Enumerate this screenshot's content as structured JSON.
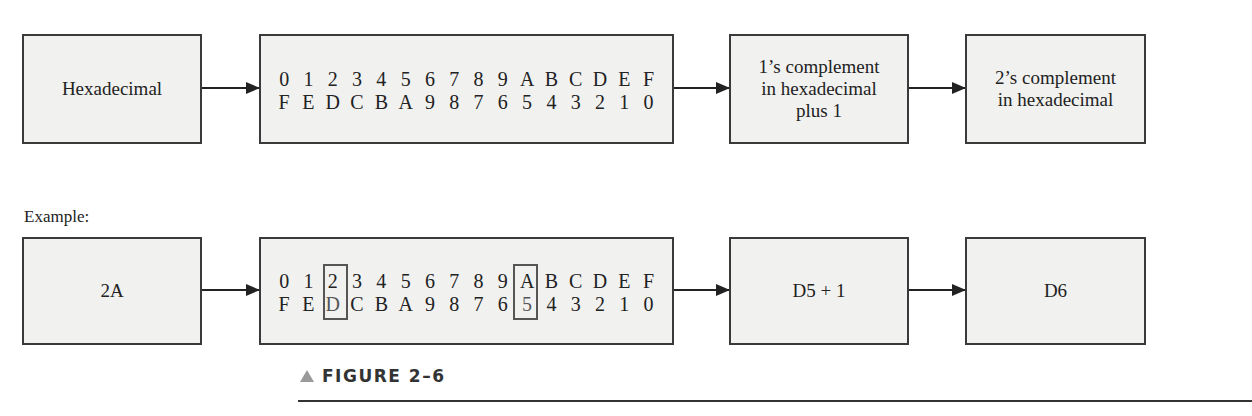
{
  "diagram": {
    "top_row": {
      "input_box": "Hexadecimal",
      "table_top": [
        "0",
        "1",
        "2",
        "3",
        "4",
        "5",
        "6",
        "7",
        "8",
        "9",
        "A",
        "B",
        "C",
        "D",
        "E",
        "F"
      ],
      "table_bottom": [
        "F",
        "E",
        "D",
        "C",
        "B",
        "A",
        "9",
        "8",
        "7",
        "6",
        "5",
        "4",
        "3",
        "2",
        "1",
        "0"
      ],
      "step_box": "1’s complement\nin hexadecimal\nplus 1",
      "result_box": "2’s complement\nin hexadecimal"
    },
    "example_label": "Example:",
    "bottom_row": {
      "input_box": "2A",
      "table_top": [
        "0",
        "1",
        "2",
        "3",
        "4",
        "5",
        "6",
        "7",
        "8",
        "9",
        "A",
        "B",
        "C",
        "D",
        "E",
        "F"
      ],
      "table_bottom": [
        "F",
        "E",
        "D",
        "C",
        "B",
        "A",
        "9",
        "8",
        "7",
        "6",
        "5",
        "4",
        "3",
        "2",
        "1",
        "0"
      ],
      "highlighted_columns": [
        "2/D",
        "A/5"
      ],
      "step_box": "D5 + 1",
      "result_box": "D6"
    },
    "figure_caption": "FIGURE 2–6"
  }
}
